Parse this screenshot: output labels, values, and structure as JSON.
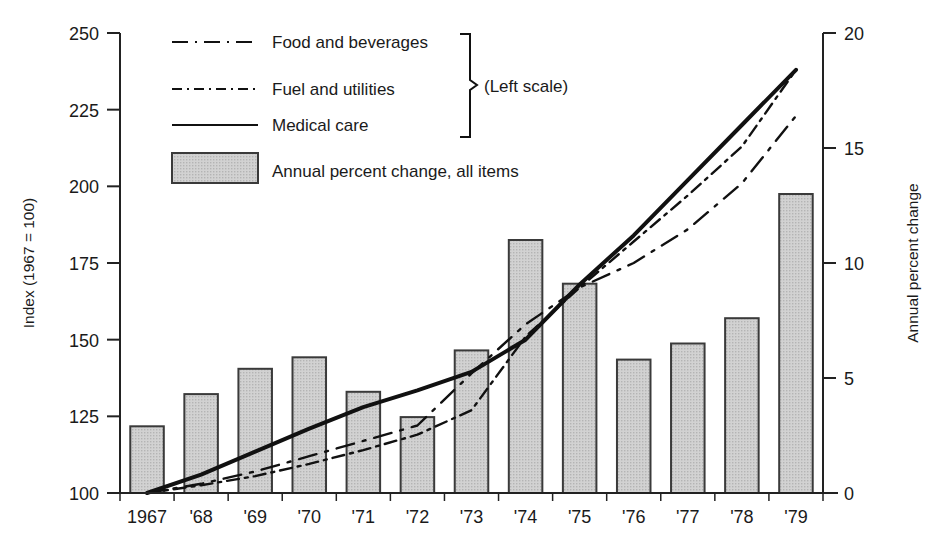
{
  "chart_data": {
    "type": "bar",
    "title": "",
    "subtitle": "",
    "xlabel": "",
    "ylabel": "Index (1967 = 100)",
    "y2label": "Annual percent change",
    "grid": false,
    "legend_position": "top-left-inside",
    "categories": [
      "1967",
      "'68",
      "'69",
      "'70",
      "'71",
      "'72",
      "'73",
      "'74",
      "'75",
      "'76",
      "'77",
      "'78",
      "'79"
    ],
    "ylim": [
      100,
      250
    ],
    "yticks": [
      100,
      125,
      150,
      175,
      200,
      225,
      250
    ],
    "y2lim": [
      0,
      20
    ],
    "y2ticks": [
      0,
      5,
      10,
      15,
      20
    ],
    "bars": {
      "name": "Annual percent change, all items",
      "axis": "right",
      "values": [
        2.9,
        4.3,
        5.4,
        5.9,
        4.4,
        3.3,
        6.2,
        11.0,
        9.1,
        5.8,
        6.5,
        7.6,
        13.0
      ]
    },
    "series": [
      {
        "name": "Food and beverages",
        "axis": "left",
        "style": "dashed",
        "values": [
          100.0,
          103.0,
          107.0,
          112.0,
          117.0,
          122.0,
          139.0,
          155.0,
          167.0,
          175.0,
          186.0,
          201.0,
          223.0
        ]
      },
      {
        "name": "Fuel and utilities",
        "axis": "left",
        "style": "dash-dot",
        "values": [
          100.0,
          102.5,
          105.5,
          109.5,
          114.0,
          119.0,
          127.0,
          151.0,
          167.0,
          182.0,
          197.0,
          213.0,
          238.0
        ]
      },
      {
        "name": "Medical care",
        "axis": "left",
        "style": "solid",
        "values": [
          100.0,
          106.0,
          113.5,
          121.0,
          128.0,
          133.5,
          139.5,
          150.0,
          168.0,
          184.0,
          202.0,
          220.0,
          238.0
        ]
      }
    ],
    "annotations": [
      "(Left scale)"
    ]
  },
  "legend": {
    "items": [
      {
        "label": "Food and beverages",
        "swatch": "dashed-line"
      },
      {
        "label": "Fuel and utilities",
        "swatch": "dash-dot-line"
      },
      {
        "label": "Medical care",
        "swatch": "solid-line"
      },
      {
        "label": "Annual percent change, all items",
        "swatch": "gray-box"
      }
    ],
    "brace_note": "(Left scale)"
  },
  "colors": {
    "bar_fill": "#c9c9c9",
    "bar_stroke": "#3a3a3a",
    "line": "#111111",
    "axis": "#222222",
    "text": "#1a1a1a"
  }
}
